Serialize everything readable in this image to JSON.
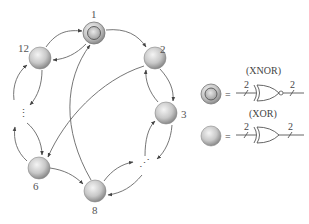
{
  "diagram": {
    "nodes": [
      {
        "id": "1",
        "label": "1",
        "type": "xnor"
      },
      {
        "id": "2",
        "label": "2",
        "type": "xor"
      },
      {
        "id": "3",
        "label": "3",
        "type": "xor"
      },
      {
        "id": "6",
        "label": "6",
        "type": "xor"
      },
      {
        "id": "8",
        "label": "8",
        "type": "xor"
      },
      {
        "id": "12",
        "label": "12",
        "type": "xor"
      }
    ],
    "ellipses": [
      {
        "between": [
          "12",
          "6"
        ],
        "text": "⋮"
      },
      {
        "between": [
          "3",
          "8"
        ],
        "text": "⋰"
      }
    ],
    "edges": [
      {
        "from": "12",
        "to": "1"
      },
      {
        "from": "1",
        "to": "12"
      },
      {
        "from": "1",
        "to": "2"
      },
      {
        "from": "2",
        "to": "3"
      },
      {
        "from": "3",
        "to": "2"
      },
      {
        "from": "2",
        "to": "6"
      },
      {
        "from": "8",
        "to": "1"
      },
      {
        "from": "6",
        "to": "8"
      },
      {
        "from": "8",
        "to": "..."
      },
      {
        "from": "...",
        "to": "8"
      },
      {
        "from": "3",
        "to": "..."
      },
      {
        "from": "...",
        "to": "3"
      },
      {
        "from": "12",
        "to": "..."
      },
      {
        "from": "...",
        "to": "12"
      },
      {
        "from": "...",
        "to": "6"
      },
      {
        "from": "6",
        "to": "..."
      }
    ],
    "legend": [
      {
        "node_type": "xnor",
        "equals": "=",
        "gate_name": "(XNOR)",
        "in_width": "2",
        "out_width": "2"
      },
      {
        "node_type": "xor",
        "equals": "=",
        "gate_name": "(XOR)",
        "in_width": "2",
        "out_width": "2"
      }
    ]
  }
}
